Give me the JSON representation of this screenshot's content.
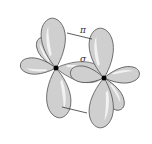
{
  "diagram": {
    "title": "",
    "labels": {
      "pi": "π",
      "sigma": "σ"
    },
    "atoms": [
      {
        "name": "left-atom",
        "x": 56,
        "y": 68
      },
      {
        "name": "right-atom",
        "x": 104,
        "y": 78
      }
    ],
    "colors": {
      "lobe_fill": "#cfcfcf",
      "lobe_stroke": "#555555",
      "nucleus": "#000000"
    }
  }
}
